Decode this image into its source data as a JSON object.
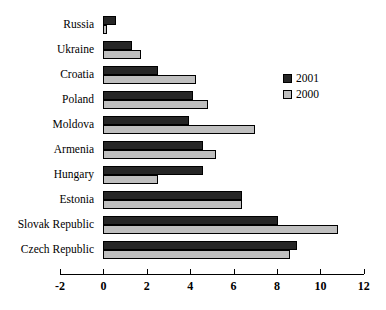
{
  "chart_data": {
    "type": "bar",
    "orientation": "horizontal",
    "title": "",
    "xlabel": "",
    "ylabel": "",
    "xlim": [
      -2,
      12
    ],
    "xticks": [
      -2,
      0,
      2,
      4,
      6,
      8,
      10,
      12
    ],
    "xtick_labels": [
      "-2",
      "0",
      "2",
      "4",
      "6",
      "8",
      "10",
      "12"
    ],
    "grid": false,
    "legend_position": "upper right",
    "categories": [
      "Russia",
      "Ukraine",
      "Croatia",
      "Poland",
      "Moldova",
      "Armenia",
      "Hungary",
      "Estonia",
      "Slovak Republic",
      "Czech Republic"
    ],
    "series": [
      {
        "name": "2001",
        "color": "#262626",
        "values": [
          0.6,
          1.3,
          2.5,
          4.15,
          3.95,
          4.6,
          4.6,
          6.4,
          8.05,
          8.9
        ]
      },
      {
        "name": "2000",
        "color": "#bfbfbf",
        "values": [
          0.15,
          1.75,
          4.25,
          4.8,
          7.0,
          5.2,
          2.5,
          6.4,
          10.8,
          8.6
        ]
      }
    ]
  },
  "legend": {
    "items": [
      {
        "label": "2001",
        "color": "#262626"
      },
      {
        "label": "2000",
        "color": "#bfbfbf"
      }
    ]
  },
  "colors": {
    "series_2001": "#262626",
    "series_2000": "#bfbfbf",
    "axis": "#000000",
    "background": "#ffffff"
  }
}
